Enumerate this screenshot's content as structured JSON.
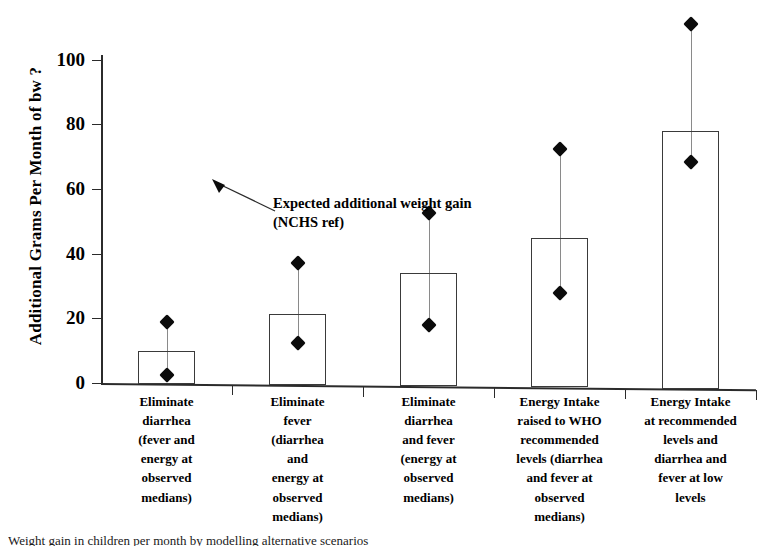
{
  "chart_data": {
    "type": "bar",
    "title": "",
    "xlabel": "",
    "ylabel": "Additional Grams Per Month of bw ?",
    "ylim": [
      0,
      100
    ],
    "yticks": [
      0,
      20,
      40,
      60,
      80,
      100
    ],
    "grid": false,
    "legend": null,
    "categories": [
      "Eliminate\ndiarrhea\n(fever and\nenergy at\nobserved\nmedians)",
      "Eliminate\nfever\n(diarrhea\nand\nenergy at\nobserved\nmedians)",
      "Eliminate\ndiarrhea\nand fever\n(energy at\nobserved\nmedians)",
      "Energy Intake\nraised to WHO\nrecommended\nlevels (diarrhea\nand fever at\nobserved\nmedians)",
      "Energy Intake\nat recommended\nlevels and\ndiarrhea and\nfever at low\nlevels"
    ],
    "values": [
      10,
      21.5,
      34,
      45,
      78
    ],
    "series": [
      {
        "name": "Bar estimate",
        "values": [
          10,
          21.5,
          34,
          45,
          78
        ]
      },
      {
        "name": "Upper marker",
        "values": [
          19,
          37,
          52.5,
          72.5,
          111
        ]
      },
      {
        "name": "Lower marker",
        "values": [
          2.5,
          12.5,
          18,
          28,
          68.5
        ]
      }
    ],
    "annotations": [
      {
        "text": "Expected additional weight gain\n(NCHS ref)",
        "arrow_target_value": 78
      }
    ]
  },
  "axis": {
    "y_title": "Additional Grams Per Month of bw ?",
    "y_tick_labels": [
      "100",
      "80",
      "60",
      "40",
      "20",
      "0"
    ]
  },
  "annotation": {
    "text": "Expected additional weight gain\n(NCHS ref)"
  },
  "caption": {
    "text": "Weight gain in children per month by modelling alternative scenarios"
  },
  "colors": {
    "axis": "#2b2b2b",
    "bar_outline": "#3a3a3a",
    "marker": "#0b0b0b",
    "whisker": "#8a8a8a",
    "background": "#ffffff"
  }
}
